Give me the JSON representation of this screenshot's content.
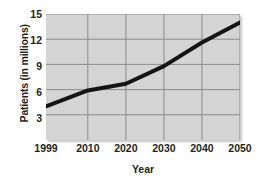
{
  "chart_data": {
    "type": "line",
    "title": "",
    "xlabel": "Year",
    "ylabel": "Patients (in millions)",
    "x": [
      1999,
      2010,
      2020,
      2030,
      2040,
      2050
    ],
    "xtick_labels": [
      "1999",
      "2010",
      "2020",
      "2030",
      "2040",
      "2050"
    ],
    "values": [
      4.0,
      5.9,
      6.7,
      8.8,
      11.6,
      14.0
    ],
    "series": [
      {
        "name": "Patients",
        "values": [
          4.0,
          5.9,
          6.7,
          8.8,
          11.6,
          14.0
        ]
      }
    ],
    "ytick_labels": [
      "3",
      "6",
      "9",
      "12",
      "15"
    ],
    "yticks": [
      3,
      6,
      9,
      12,
      15
    ],
    "ylim": [
      0,
      15
    ],
    "xlim": [
      1999,
      2050
    ],
    "grid": true,
    "legend": "none",
    "plot_background_color": "#d4d4d4",
    "grid_color": "#8c8c8c",
    "line_color": "#151515",
    "line_width": 4,
    "page_background_color": "#ffffff",
    "text_color": "#231f20"
  }
}
